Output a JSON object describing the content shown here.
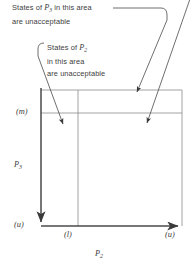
{
  "figure": {
    "annotations": [
      {
        "id": "p3-note",
        "line1_pre": "States of ",
        "variable": "P",
        "variable_sub": "3",
        "line1_post": " in this area",
        "line2": "are unacceptable"
      },
      {
        "id": "p2-note",
        "line1_pre": "States of ",
        "variable": "P",
        "variable_sub": "2",
        "line1_post": "",
        "line2": "in this area",
        "line3": "are unacceptable"
      }
    ],
    "axes": {
      "y_label": "P",
      "y_label_sub": "3",
      "x_label": "P",
      "x_label_sub": "2"
    },
    "ticks": {
      "y_upper": "(m)",
      "y_origin": "(u)",
      "x_mid": "(l)",
      "x_right": "(u)"
    },
    "colors": {
      "line": "#4a4a4a",
      "grid": "#8a8a8a",
      "text": "#3d3d3d",
      "background": "#ffffff"
    }
  }
}
